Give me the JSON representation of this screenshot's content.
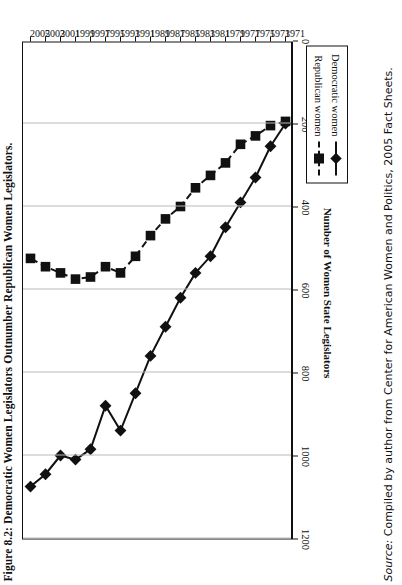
{
  "figure": {
    "title": "Figure 8.2: Democratic Women Legislators Outnumber Republican Women Legislators.",
    "source_prefix": "Source:",
    "source_text": " Compiled by author from Center for American Women and Politics, 2005 Fact Sheets."
  },
  "legend": {
    "position": "bottom-right-inside",
    "items": [
      {
        "label": "Democratic women",
        "marker": "diamond",
        "line": "solid",
        "color": "#111111"
      },
      {
        "label": "Republican women",
        "marker": "square",
        "line": "dashed",
        "color": "#111111"
      }
    ]
  },
  "axes": {
    "value_axis_title": "Number of Women State Legislators",
    "value_ticks": [
      "0",
      "200",
      "400",
      "600",
      "800",
      "1000",
      "1200"
    ],
    "year_ticks": [
      "1971",
      "1973",
      "1975",
      "1977",
      "1979",
      "1981",
      "1983",
      "1985",
      "1987",
      "1989",
      "1991",
      "1993",
      "1995",
      "1997",
      "1999",
      "2001",
      "2003",
      "2005"
    ]
  },
  "chart_data": {
    "type": "line",
    "title": "Figure 8.2: Democratic Women Legislators Outnumber Republican Women Legislators.",
    "xlabel": "",
    "ylabel": "Number of Women State Legislators",
    "orientation": "rotated-90-ccw",
    "grid": true,
    "legend_position": "inside-bottom-right",
    "xlim": [
      1971,
      2005
    ],
    "ylim": [
      0,
      1200
    ],
    "ytick_step": 200,
    "x": [
      1971,
      1973,
      1975,
      1977,
      1979,
      1981,
      1983,
      1985,
      1987,
      1989,
      1991,
      1993,
      1995,
      1997,
      1999,
      2001,
      2003,
      2005
    ],
    "categories": [
      "1971",
      "1973",
      "1975",
      "1977",
      "1979",
      "1981",
      "1983",
      "1985",
      "1987",
      "1989",
      "1991",
      "1993",
      "1995",
      "1997",
      "1999",
      "2001",
      "2003",
      "2005"
    ],
    "series": [
      {
        "name": "Democratic women",
        "marker": "diamond",
        "line": "solid",
        "color": "#111111",
        "values": [
          200,
          255,
          330,
          390,
          450,
          520,
          560,
          620,
          690,
          760,
          850,
          940,
          880,
          985,
          1010,
          1000,
          1045,
          1075
        ]
      },
      {
        "name": "Republican women",
        "marker": "square",
        "line": "dashed",
        "color": "#111111",
        "values": [
          195,
          205,
          230,
          250,
          295,
          325,
          355,
          400,
          430,
          470,
          520,
          560,
          545,
          570,
          575,
          560,
          545,
          525
        ]
      }
    ]
  }
}
